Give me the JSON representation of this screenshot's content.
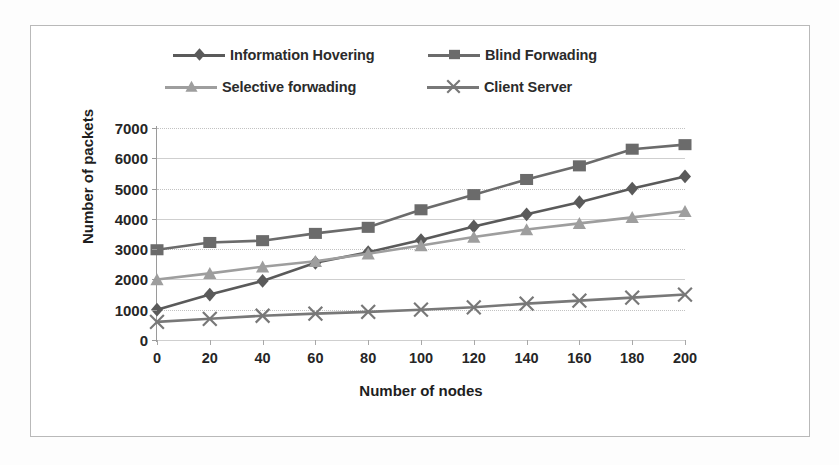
{
  "chart_data": {
    "type": "line",
    "title": "",
    "xlabel": "Number of nodes",
    "ylabel": "Number of packets",
    "x": [
      0,
      20,
      40,
      60,
      80,
      100,
      120,
      140,
      160,
      180,
      200
    ],
    "xlim": [
      0,
      200
    ],
    "ylim": [
      0,
      7000
    ],
    "xticks": [
      "0",
      "20",
      "40",
      "60",
      "80",
      "100",
      "120",
      "140",
      "160",
      "180",
      "200"
    ],
    "yticks": [
      "0",
      "1000",
      "2000",
      "3000",
      "4000",
      "5000",
      "6000",
      "7000"
    ],
    "grid": true,
    "legend_position": "top",
    "series": [
      {
        "name": "Information Hovering",
        "marker": "diamond",
        "color": "#5a5a5a",
        "values": [
          1000,
          1500,
          1950,
          2550,
          2900,
          3300,
          3750,
          4150,
          4550,
          5000,
          5400
        ]
      },
      {
        "name": "Blind Forwading",
        "marker": "square",
        "color": "#6b6b6b",
        "values": [
          2980,
          3220,
          3280,
          3520,
          3720,
          4300,
          4800,
          5300,
          5750,
          6300,
          6450
        ]
      },
      {
        "name": "Selective forwading",
        "marker": "triangle",
        "color": "#9e9e9e",
        "values": [
          2000,
          2200,
          2420,
          2600,
          2850,
          3120,
          3400,
          3650,
          3850,
          4050,
          4250
        ]
      },
      {
        "name": "Client Server",
        "marker": "cross",
        "color": "#787878",
        "values": [
          600,
          700,
          800,
          870,
          930,
          1000,
          1080,
          1200,
          1300,
          1400,
          1500
        ]
      }
    ]
  },
  "legend": {
    "entries": [
      {
        "label": "Information Hovering"
      },
      {
        "label": "Blind Forwading"
      },
      {
        "label": "Selective forwading"
      },
      {
        "label": "Client Server"
      }
    ]
  },
  "colors": {
    "grid": "#c2c2c2",
    "axis": "#9a9a9a",
    "frame": "#b9b9b9",
    "text": "#262626"
  }
}
